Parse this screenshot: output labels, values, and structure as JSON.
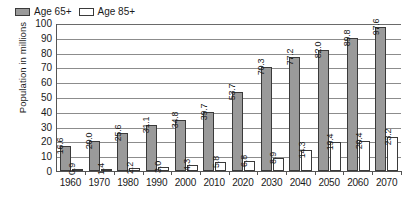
{
  "chart_data": {
    "type": "bar",
    "title": "",
    "xlabel": "",
    "ylabel": "Population in millions",
    "ylim": [
      0,
      100
    ],
    "ytick_step": 10,
    "yticks": [
      100,
      90,
      80,
      70,
      60,
      50,
      40,
      30,
      20,
      10,
      0
    ],
    "grid": true,
    "legend_position": "top-left-inside",
    "categories": [
      "1960",
      "1970",
      "1980",
      "1990",
      "2000",
      "2010",
      "2020",
      "2030",
      "2040",
      "2050",
      "2060",
      "2070"
    ],
    "series": [
      {
        "name": "Age 65+",
        "color": "#9a9a9a",
        "values": [
          16.6,
          20.0,
          25.6,
          31.1,
          34.8,
          39.7,
          53.7,
          70.3,
          77.2,
          82.0,
          89.8,
          97.6
        ],
        "labels": [
          "16.6",
          "20.0",
          "25.6",
          "31.1",
          "34.8",
          "39.7",
          "53.7",
          "70.3",
          "77.2",
          "82.0",
          "89.8",
          "97.6"
        ]
      },
      {
        "name": "Age 85+",
        "color": "#ffffff",
        "values": [
          0.9,
          1.4,
          2.2,
          3.0,
          4.3,
          5.8,
          6.8,
          8.9,
          14.3,
          19.4,
          20.4,
          23.2
        ],
        "labels": [
          "0.9",
          "1.4",
          "2.2",
          "3.0",
          "4.3",
          "5.8",
          "6.8",
          "8.9",
          "14.3",
          "19.4",
          "20.4",
          "23.2"
        ]
      }
    ]
  },
  "legend": {
    "items": [
      {
        "label": "Age 65+",
        "swatch": "gray-filled-swatch"
      },
      {
        "label": "Age 85+",
        "swatch": "white-open-swatch"
      }
    ]
  }
}
